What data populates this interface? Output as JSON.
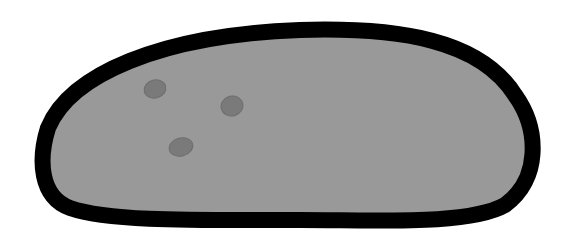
{
  "illustration": {
    "subject": "stone",
    "colors": {
      "background": "#ffffff",
      "outline": "#000000",
      "fill": "#999999",
      "spot": "#7a7a7a",
      "spot_edge": "#6e6e6e"
    },
    "spots": [
      {
        "cx": 155,
        "cy": 89,
        "rx": 11,
        "ry": 9
      },
      {
        "cx": 232,
        "cy": 106,
        "rx": 11,
        "ry": 10
      },
      {
        "cx": 181,
        "cy": 147,
        "rx": 12,
        "ry": 9
      }
    ]
  }
}
